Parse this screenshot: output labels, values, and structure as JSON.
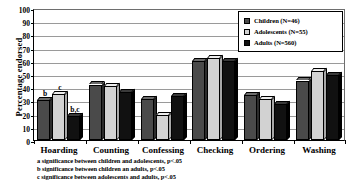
{
  "chart_data": {
    "type": "bar",
    "title": "",
    "xlabel": "",
    "ylabel": "Percentage endorsed",
    "ylim": [
      0,
      100
    ],
    "yticks": [
      100,
      90,
      80,
      70,
      60,
      50,
      40,
      30,
      20,
      10,
      0
    ],
    "grid": true,
    "legend_position": "top-right",
    "categories": [
      "Hoarding",
      "Counting",
      "Confessing",
      "Checking",
      "Ordering",
      "Washing"
    ],
    "series": [
      {
        "name": "Children (N=46)",
        "color": "#4a4a4a",
        "values": [
          30,
          42,
          31,
          60,
          34,
          45
        ]
      },
      {
        "name": "Adolescents (N=55)",
        "color": "#d2d2d2",
        "values": [
          35,
          41,
          19,
          62,
          31,
          52
        ]
      },
      {
        "name": "Adults (N=560)",
        "color": "#111111",
        "values": [
          18,
          36,
          33,
          60,
          27,
          49
        ]
      }
    ],
    "annotations": [
      {
        "text": "b",
        "category": "Hoarding",
        "series": "Children (N=46)",
        "value": 30
      },
      {
        "text": "c",
        "category": "Hoarding",
        "series": "Adolescents (N=55)",
        "value": 35
      },
      {
        "text": "b,c",
        "category": "Hoarding",
        "series": "Adults (N=560)",
        "value": 18
      }
    ]
  },
  "legend": {
    "items": [
      {
        "label": "Children (N=46)",
        "swatch_class": "s-children"
      },
      {
        "label": "Adolescents (N=55)",
        "swatch_class": "s-adolescents"
      },
      {
        "label": "Adults (N=560)",
        "swatch_class": "s-adults"
      }
    ]
  },
  "footnotes": [
    "a significance between children and adolescents, p<.05",
    "b significance between children an adults, p<.05",
    "c significance between adolescents and adults, p<.05"
  ]
}
